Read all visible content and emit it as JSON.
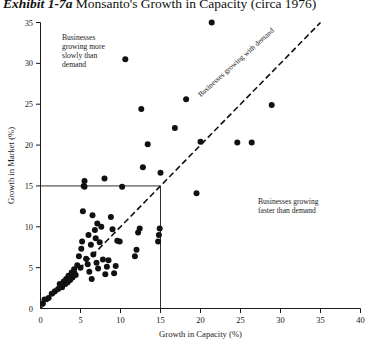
{
  "title": {
    "exhibit_label": "Exhibit 1-7a",
    "text": "Monsanto's Growth in Capacity (circa 1976)"
  },
  "annotations": {
    "slow": "Businesses\ngrowing more\nslowly than\ndemand",
    "with_demand": "Businesses growing with demand",
    "fast": "Businesses growing\nfaster than demand"
  },
  "chart_data": {
    "type": "scatter",
    "title": "Monsanto's Growth in Capacity (circa 1976)",
    "xlabel": "Growth in Capacity (%)",
    "ylabel": "Growth in Market (%)",
    "xlim": [
      0,
      40
    ],
    "ylim": [
      0,
      35
    ],
    "xticks": [
      0,
      5,
      10,
      15,
      20,
      25,
      30,
      35,
      40
    ],
    "yticks": [
      0,
      5,
      10,
      15,
      20,
      25,
      30,
      35
    ],
    "grid": false,
    "legend": "none",
    "reference_lines": [
      {
        "name": "parity-diagonal",
        "type": "diagonal",
        "from": [
          0,
          0
        ],
        "to": [
          35,
          35
        ],
        "style": "dashed",
        "label": "Businesses growing with demand"
      },
      {
        "name": "market-15-horizontal",
        "type": "horizontal",
        "y": 15,
        "x_from": 0,
        "x_to": 15,
        "style": "solid"
      },
      {
        "name": "capacity-15-vertical",
        "type": "vertical",
        "x": 15,
        "y_from": 0,
        "y_to": 15,
        "style": "solid"
      }
    ],
    "series": [
      {
        "name": "Monsanto businesses",
        "marker": "filled-circle",
        "color": "#111111",
        "points": [
          [
            0.3,
            0.6
          ],
          [
            0.5,
            1.1
          ],
          [
            1.0,
            1.3
          ],
          [
            1.4,
            1.8
          ],
          [
            1.8,
            2.1
          ],
          [
            2.2,
            2.4
          ],
          [
            2.4,
            3.0
          ],
          [
            2.7,
            2.6
          ],
          [
            2.9,
            3.3
          ],
          [
            3.1,
            3.0
          ],
          [
            3.2,
            3.6
          ],
          [
            3.4,
            3.2
          ],
          [
            3.5,
            4.0
          ],
          [
            3.7,
            3.5
          ],
          [
            3.9,
            4.4
          ],
          [
            4.0,
            3.8
          ],
          [
            4.2,
            4.8
          ],
          [
            4.4,
            4.1
          ],
          [
            4.6,
            5.3
          ],
          [
            4.8,
            6.4
          ],
          [
            5.0,
            5.0
          ],
          [
            5.1,
            7.3
          ],
          [
            5.2,
            8.2
          ],
          [
            5.3,
            11.9
          ],
          [
            5.4,
            15.0
          ],
          [
            5.5,
            15.6
          ],
          [
            5.5,
            14.9
          ],
          [
            5.7,
            6.1
          ],
          [
            5.9,
            5.4
          ],
          [
            6.0,
            9.0
          ],
          [
            6.1,
            4.5
          ],
          [
            6.3,
            7.8
          ],
          [
            6.4,
            3.6
          ],
          [
            6.5,
            11.4
          ],
          [
            6.6,
            6.6
          ],
          [
            6.8,
            9.6
          ],
          [
            6.9,
            8.6
          ],
          [
            7.0,
            5.6
          ],
          [
            7.1,
            10.4
          ],
          [
            7.2,
            4.9
          ],
          [
            7.4,
            8.1
          ],
          [
            7.6,
            10.0
          ],
          [
            7.8,
            6.0
          ],
          [
            8.0,
            15.9
          ],
          [
            8.1,
            4.2
          ],
          [
            8.3,
            5.1
          ],
          [
            8.5,
            5.9
          ],
          [
            8.8,
            11.2
          ],
          [
            9.0,
            9.7
          ],
          [
            9.2,
            4.3
          ],
          [
            9.4,
            5.2
          ],
          [
            9.6,
            8.3
          ],
          [
            9.9,
            8.2
          ],
          [
            10.2,
            14.9
          ],
          [
            10.6,
            30.5
          ],
          [
            11.8,
            6.4
          ],
          [
            12.0,
            7.2
          ],
          [
            12.2,
            9.3
          ],
          [
            12.4,
            9.8
          ],
          [
            12.6,
            24.4
          ],
          [
            12.8,
            17.3
          ],
          [
            13.4,
            20.1
          ],
          [
            14.7,
            8.2
          ],
          [
            14.8,
            9.0
          ],
          [
            14.9,
            9.8
          ],
          [
            15.0,
            16.6
          ],
          [
            16.8,
            22.1
          ],
          [
            18.2,
            25.6
          ],
          [
            19.5,
            14.1
          ],
          [
            20.0,
            20.4
          ],
          [
            21.4,
            35.0
          ],
          [
            24.6,
            20.3
          ],
          [
            26.4,
            20.3
          ],
          [
            28.9,
            24.9
          ]
        ]
      }
    ]
  }
}
